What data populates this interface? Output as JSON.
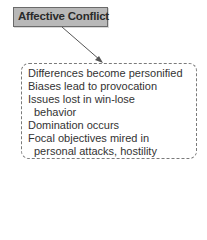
{
  "diagram": {
    "header": {
      "label": "Affective Conflict",
      "fill": "#b8b8b8"
    },
    "arrow": {
      "from": "header",
      "to": "detail-box"
    },
    "details": {
      "lines": [
        "Differences become personified",
        "Biases lead to provocation",
        "Issues lost in win-lose",
        "behavior",
        "Domination occurs",
        "Focal objectives mired in",
        "personal attacks, hostility"
      ]
    }
  }
}
